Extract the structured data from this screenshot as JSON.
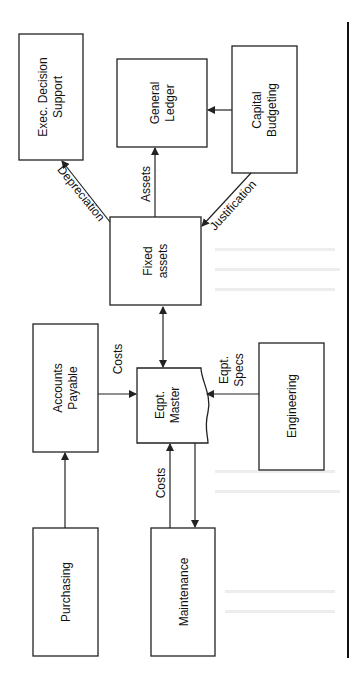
{
  "diagram": {
    "orientation": "rotated -90deg",
    "nodes": {
      "exec": {
        "line1": "Exec. Decision",
        "line2": "Support"
      },
      "gl": {
        "line1": "General",
        "line2": "Ledger"
      },
      "capbud": {
        "line1": "Capital",
        "line2": "Budgeting"
      },
      "fixed": {
        "line1": "Fixed",
        "line2": "assets"
      },
      "ap": {
        "line1": "Accounts",
        "line2": "Payable"
      },
      "master": {
        "line1": "Eqpt.",
        "line2": "Master"
      },
      "eng": {
        "line1": "Engineering"
      },
      "purch": {
        "line1": "Purchasing"
      },
      "maint": {
        "line1": "Maintenance"
      }
    },
    "edges": {
      "depreciation": "Depreciation",
      "assets": "Assets",
      "justification": "Justification",
      "costs_ap": "Costs",
      "specs1": "Eqpt.",
      "specs2": "Specs",
      "costs_maint": "Costs"
    }
  }
}
